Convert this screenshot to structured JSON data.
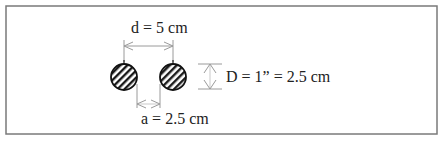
{
  "diagram": {
    "labels": {
      "center_distance": "d = 5 cm",
      "diameter": "D = 1” = 2.5 cm",
      "gap": "a = 2.5 cm"
    },
    "elements": [
      {
        "type": "circle",
        "name": "left-bar",
        "cx": 124,
        "cy": 77,
        "r": 13,
        "fill": "hatched"
      },
      {
        "type": "circle",
        "name": "right-bar",
        "cx": 173,
        "cy": 77,
        "r": 13,
        "fill": "hatched"
      }
    ],
    "colors": {
      "border": "#7a7a7a",
      "ink": "#222222",
      "dimension_line": "#9a9a9a",
      "background": "#ffffff"
    }
  }
}
